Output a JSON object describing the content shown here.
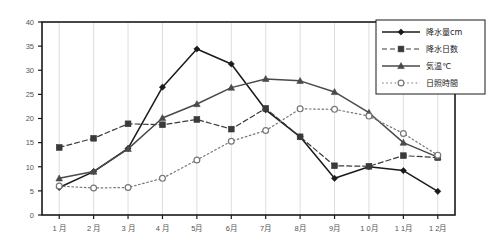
{
  "chart_data": {
    "type": "line",
    "title": "",
    "subtitle": "",
    "xlabel": "",
    "ylabel": "",
    "ylim": [
      0,
      40
    ],
    "ytick_values": [
      0,
      5,
      10,
      15,
      20,
      25,
      30,
      35,
      40
    ],
    "ytick_labels": [
      "0",
      "5",
      "10",
      "15",
      "20",
      "25",
      "30",
      "35",
      "40"
    ],
    "grid": "vertical",
    "legend_position": "top-right",
    "categories": [
      "1 月",
      "2 月",
      "3 月",
      "4 月",
      "5月",
      "6月",
      "7月",
      "8月",
      "9月",
      "1 0月",
      "1 1月",
      "1 2月"
    ],
    "series": [
      {
        "name": "降水量cm",
        "marker": "filled-diamond",
        "line": "solid",
        "color": "#1a1a1a",
        "values": [
          5.7,
          9.0,
          13.8,
          26.5,
          34.4,
          31.3,
          21.8,
          16.2,
          7.6,
          10.0,
          9.2,
          4.9
        ]
      },
      {
        "name": "降水日数",
        "marker": "filled-square",
        "line": "dashed",
        "color": "#3a3a3a",
        "values": [
          14.0,
          15.9,
          18.9,
          18.7,
          19.8,
          17.8,
          22.1,
          16.2,
          10.2,
          10.1,
          12.3,
          11.9
        ]
      },
      {
        "name": "気温℃",
        "marker": "filled-triangle",
        "line": "solid",
        "color": "#4a4a4a",
        "values": [
          7.6,
          9.0,
          13.7,
          20.1,
          23.0,
          26.4,
          28.2,
          27.8,
          25.5,
          21.2,
          15.0,
          12.0
        ]
      },
      {
        "name": "日照時間",
        "marker": "open-circle",
        "line": "dotted",
        "color": "#777777",
        "values": [
          6.0,
          5.6,
          5.7,
          7.6,
          11.4,
          15.3,
          17.5,
          22.0,
          21.9,
          20.5,
          16.9,
          12.4
        ]
      }
    ]
  }
}
